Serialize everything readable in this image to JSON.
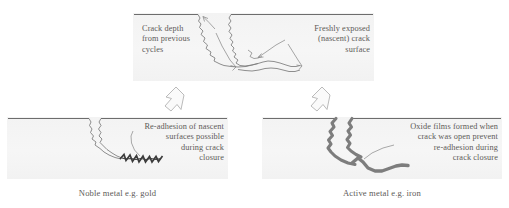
{
  "figure": {
    "background_color": "#ffffff",
    "panel_fill": "#f4f4f4",
    "line_color": "#6f6f6f",
    "oxide_color": "#7a7a7a",
    "text_color": "#5d5a58"
  },
  "panels": {
    "top": {
      "name": "open-crack-panel",
      "annotations": {
        "left": "Crack depth\nfrom previous\ncycles",
        "right": "Freshly exposed\n(nascent) crack\nsurface"
      }
    },
    "bottom_left": {
      "name": "noble-metal-panel",
      "annotation": "Re-adhesion of nascent\nsurfaces possible\nduring crack\nclosure",
      "caption": "Noble metal e.g. gold"
    },
    "bottom_right": {
      "name": "active-metal-panel",
      "annotation": "Oxide films formed when\ncrack was open prevent\nre-adhesion during\ncrack closure",
      "caption": "Active metal e.g. iron"
    }
  },
  "arrows": {
    "left": "hollow-arrow-up-left",
    "right": "hollow-arrow-up-right"
  }
}
